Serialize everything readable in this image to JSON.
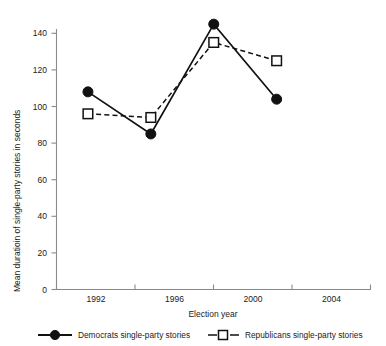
{
  "chart_data": {
    "type": "line",
    "title": "",
    "xlabel": "Election year",
    "ylabel": "Mean duratioin of single-party stories in seconds",
    "categories": [
      "1992",
      "1996",
      "2000",
      "2004"
    ],
    "series": [
      {
        "name": "Democrats single-party stories",
        "values": [
          108,
          85,
          145,
          104
        ],
        "marker": "filled-circle",
        "line_style": "solid",
        "color": "#111111"
      },
      {
        "name": "Republicans single-party stories",
        "values": [
          96,
          94,
          135,
          125
        ],
        "marker": "open-square",
        "line_style": "dashed",
        "color": "#111111"
      }
    ],
    "ylim": [
      0,
      140
    ],
    "yticks": [
      0,
      20,
      40,
      60,
      80,
      100,
      120,
      140
    ],
    "ytick_labels": [
      "0",
      "20",
      "40",
      "60",
      "80",
      "100",
      "120",
      "140"
    ],
    "xlim": [
      0,
      5
    ],
    "grid": false,
    "legend_position": "bottom"
  },
  "axes": {
    "y_label": "Mean duratioin of single-party stories in seconds",
    "x_label": "Election year",
    "y_ticks": [
      "0",
      "20",
      "40",
      "60",
      "80",
      "100",
      "120",
      "140"
    ],
    "x_ticks": [
      "1992",
      "1996",
      "2000",
      "2004"
    ]
  },
  "legend": {
    "items": [
      {
        "label": "Democrats single-party stories",
        "marker": "filled-circle-icon",
        "style": "solid"
      },
      {
        "label": "Republicans single-party stories",
        "marker": "open-square-icon",
        "style": "dashed"
      }
    ]
  }
}
